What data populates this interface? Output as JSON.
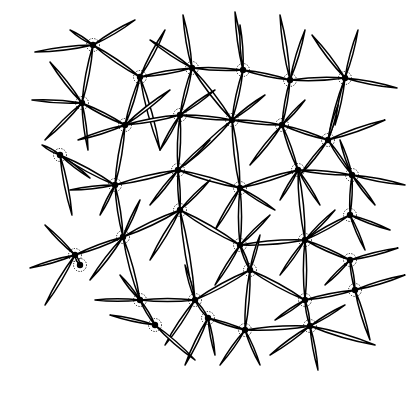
{
  "figure": {
    "width": 418,
    "height": 393,
    "colors": {
      "background": "#ffffff",
      "ink": "#000000"
    },
    "nodes": [
      [
        93,
        45
      ],
      [
        140,
        77
      ],
      [
        192,
        68
      ],
      [
        243,
        70
      ],
      [
        290,
        80
      ],
      [
        345,
        78
      ],
      [
        82,
        103
      ],
      [
        125,
        125
      ],
      [
        180,
        115
      ],
      [
        232,
        120
      ],
      [
        282,
        125
      ],
      [
        328,
        140
      ],
      [
        60,
        155
      ],
      [
        115,
        185
      ],
      [
        178,
        170
      ],
      [
        240,
        188
      ],
      [
        298,
        170
      ],
      [
        352,
        175
      ],
      [
        75,
        255
      ],
      [
        123,
        237
      ],
      [
        180,
        210
      ],
      [
        240,
        245
      ],
      [
        305,
        240
      ],
      [
        350,
        260
      ],
      [
        80,
        265
      ],
      [
        140,
        300
      ],
      [
        195,
        300
      ],
      [
        250,
        270
      ],
      [
        305,
        300
      ],
      [
        355,
        290
      ],
      [
        208,
        318
      ],
      [
        310,
        326
      ],
      [
        155,
        325
      ],
      [
        245,
        330
      ],
      [
        350,
        215
      ]
    ],
    "spicules": [
      [
        93,
        45,
        35,
        52
      ],
      [
        93,
        45,
        135,
        20
      ],
      [
        93,
        45,
        140,
        77
      ],
      [
        93,
        45,
        82,
        103
      ],
      [
        93,
        45,
        70,
        30
      ],
      [
        140,
        77,
        165,
        30
      ],
      [
        140,
        77,
        192,
        68
      ],
      [
        140,
        77,
        125,
        125
      ],
      [
        140,
        77,
        160,
        150
      ],
      [
        192,
        68,
        183,
        15
      ],
      [
        192,
        68,
        243,
        70
      ],
      [
        192,
        68,
        232,
        120
      ],
      [
        192,
        68,
        180,
        115
      ],
      [
        192,
        68,
        150,
        40
      ],
      [
        243,
        70,
        235,
        12
      ],
      [
        243,
        70,
        290,
        80
      ],
      [
        243,
        70,
        232,
        120
      ],
      [
        243,
        70,
        240,
        25
      ],
      [
        290,
        80,
        280,
        15
      ],
      [
        290,
        80,
        345,
        78
      ],
      [
        290,
        80,
        282,
        125
      ],
      [
        290,
        80,
        305,
        30
      ],
      [
        345,
        78,
        312,
        35
      ],
      [
        345,
        78,
        358,
        30
      ],
      [
        345,
        78,
        397,
        88
      ],
      [
        345,
        78,
        328,
        140
      ],
      [
        345,
        78,
        335,
        125
      ],
      [
        82,
        103,
        32,
        100
      ],
      [
        82,
        103,
        50,
        62
      ],
      [
        82,
        103,
        125,
        125
      ],
      [
        82,
        103,
        45,
        140
      ],
      [
        82,
        103,
        88,
        150
      ],
      [
        125,
        125,
        180,
        115
      ],
      [
        125,
        125,
        115,
        185
      ],
      [
        125,
        125,
        78,
        140
      ],
      [
        125,
        125,
        170,
        90
      ],
      [
        180,
        115,
        232,
        120
      ],
      [
        180,
        115,
        178,
        170
      ],
      [
        180,
        115,
        160,
        150
      ],
      [
        180,
        115,
        215,
        90
      ],
      [
        232,
        120,
        282,
        125
      ],
      [
        232,
        120,
        240,
        188
      ],
      [
        232,
        120,
        185,
        165
      ],
      [
        232,
        120,
        265,
        95
      ],
      [
        282,
        125,
        328,
        140
      ],
      [
        282,
        125,
        298,
        170
      ],
      [
        282,
        125,
        250,
        165
      ],
      [
        282,
        125,
        305,
        100
      ],
      [
        328,
        140,
        385,
        120
      ],
      [
        328,
        140,
        352,
        175
      ],
      [
        328,
        140,
        338,
        105
      ],
      [
        328,
        140,
        300,
        175
      ],
      [
        60,
        155,
        115,
        185
      ],
      [
        60,
        155,
        42,
        145
      ],
      [
        60,
        155,
        90,
        178
      ],
      [
        60,
        155,
        72,
        215
      ],
      [
        115,
        185,
        178,
        170
      ],
      [
        115,
        185,
        123,
        237
      ],
      [
        115,
        185,
        70,
        190
      ],
      [
        115,
        185,
        100,
        215
      ],
      [
        178,
        170,
        240,
        188
      ],
      [
        178,
        170,
        180,
        210
      ],
      [
        178,
        170,
        210,
        140
      ],
      [
        178,
        170,
        150,
        205
      ],
      [
        240,
        188,
        298,
        170
      ],
      [
        240,
        188,
        240,
        245
      ],
      [
        240,
        188,
        215,
        230
      ],
      [
        240,
        188,
        275,
        210
      ],
      [
        298,
        170,
        352,
        175
      ],
      [
        298,
        170,
        305,
        240
      ],
      [
        298,
        170,
        320,
        205
      ],
      [
        298,
        170,
        280,
        200
      ],
      [
        352,
        175,
        405,
        185
      ],
      [
        352,
        175,
        350,
        215
      ],
      [
        352,
        175,
        340,
        140
      ],
      [
        352,
        175,
        375,
        205
      ],
      [
        350,
        215,
        365,
        250
      ],
      [
        350,
        215,
        305,
        240
      ],
      [
        350,
        215,
        390,
        230
      ],
      [
        75,
        255,
        30,
        268
      ],
      [
        75,
        255,
        45,
        225
      ],
      [
        75,
        255,
        123,
        237
      ],
      [
        75,
        255,
        80,
        265
      ],
      [
        75,
        255,
        45,
        305
      ],
      [
        123,
        237,
        180,
        210
      ],
      [
        123,
        237,
        140,
        300
      ],
      [
        123,
        237,
        90,
        280
      ],
      [
        123,
        237,
        140,
        200
      ],
      [
        180,
        210,
        240,
        245
      ],
      [
        180,
        210,
        195,
        300
      ],
      [
        180,
        210,
        150,
        260
      ],
      [
        180,
        210,
        210,
        180
      ],
      [
        240,
        245,
        305,
        240
      ],
      [
        240,
        245,
        250,
        270
      ],
      [
        240,
        245,
        215,
        285
      ],
      [
        240,
        245,
        270,
        215
      ],
      [
        305,
        240,
        350,
        260
      ],
      [
        305,
        240,
        305,
        300
      ],
      [
        305,
        240,
        280,
        275
      ],
      [
        305,
        240,
        335,
        210
      ],
      [
        350,
        260,
        398,
        248
      ],
      [
        350,
        260,
        355,
        290
      ],
      [
        350,
        260,
        325,
        285
      ],
      [
        140,
        300,
        195,
        300
      ],
      [
        140,
        300,
        95,
        300
      ],
      [
        140,
        300,
        155,
        325
      ],
      [
        140,
        300,
        120,
        275
      ],
      [
        195,
        300,
        250,
        270
      ],
      [
        195,
        300,
        208,
        318
      ],
      [
        195,
        300,
        165,
        345
      ],
      [
        195,
        300,
        185,
        265
      ],
      [
        250,
        270,
        305,
        300
      ],
      [
        250,
        270,
        245,
        330
      ],
      [
        250,
        270,
        260,
        235
      ],
      [
        305,
        300,
        355,
        290
      ],
      [
        305,
        300,
        310,
        326
      ],
      [
        305,
        300,
        275,
        320
      ],
      [
        355,
        290,
        405,
        275
      ],
      [
        355,
        290,
        370,
        340
      ],
      [
        208,
        318,
        245,
        330
      ],
      [
        208,
        318,
        185,
        365
      ],
      [
        208,
        318,
        215,
        355
      ],
      [
        155,
        325,
        195,
        360
      ],
      [
        155,
        325,
        110,
        315
      ],
      [
        245,
        330,
        310,
        326
      ],
      [
        245,
        330,
        220,
        365
      ],
      [
        245,
        330,
        260,
        365
      ],
      [
        310,
        326,
        375,
        345
      ],
      [
        310,
        326,
        318,
        370
      ],
      [
        310,
        326,
        270,
        355
      ],
      [
        310,
        326,
        345,
        305
      ]
    ]
  }
}
